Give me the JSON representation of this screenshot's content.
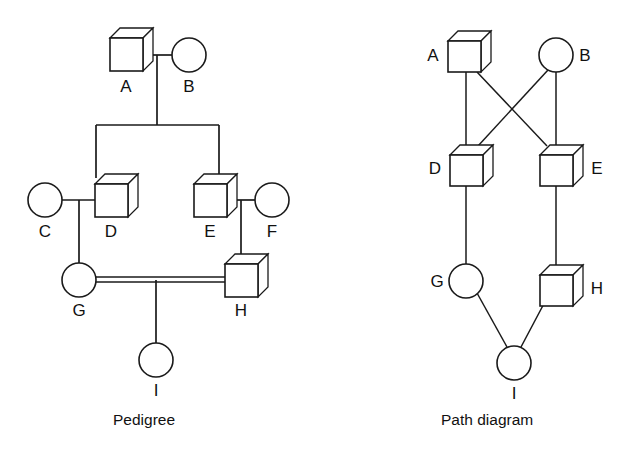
{
  "figure": {
    "background_color": "#ffffff",
    "line_color": "#1a1a1a",
    "shape_fill": "#ffffff"
  },
  "panels": [
    {
      "id": "pedigree",
      "caption": "Pedigree",
      "nodes": [
        {
          "id": "A",
          "label": "A",
          "shape": "square",
          "generation": 1
        },
        {
          "id": "B",
          "label": "B",
          "shape": "circle",
          "generation": 1
        },
        {
          "id": "C",
          "label": "C",
          "shape": "circle",
          "generation": 2
        },
        {
          "id": "D",
          "label": "D",
          "shape": "square",
          "generation": 2
        },
        {
          "id": "E",
          "label": "E",
          "shape": "square",
          "generation": 2
        },
        {
          "id": "F",
          "label": "F",
          "shape": "circle",
          "generation": 2
        },
        {
          "id": "G",
          "label": "G",
          "shape": "circle",
          "generation": 3
        },
        {
          "id": "H",
          "label": "H",
          "shape": "square",
          "generation": 3
        },
        {
          "id": "I",
          "label": "I",
          "shape": "circle",
          "generation": 4
        }
      ],
      "matings": [
        {
          "partners": [
            "A",
            "B"
          ],
          "type": "single-line",
          "children": [
            "D",
            "E"
          ]
        },
        {
          "partners": [
            "C",
            "D"
          ],
          "type": "single-line",
          "children": [
            "G"
          ]
        },
        {
          "partners": [
            "E",
            "F"
          ],
          "type": "single-line",
          "children": [
            "H"
          ]
        },
        {
          "partners": [
            "G",
            "H"
          ],
          "type": "double-line-consanguineous",
          "children": [
            "I"
          ]
        }
      ]
    },
    {
      "id": "path-diagram",
      "caption": "Path diagram",
      "nodes": [
        {
          "id": "A",
          "label": "A",
          "shape": "square",
          "label_side": "left"
        },
        {
          "id": "B",
          "label": "B",
          "shape": "circle",
          "label_side": "right"
        },
        {
          "id": "D",
          "label": "D",
          "shape": "square",
          "label_side": "left"
        },
        {
          "id": "E",
          "label": "E",
          "shape": "square",
          "label_side": "right"
        },
        {
          "id": "G",
          "label": "G",
          "shape": "circle",
          "label_side": "left"
        },
        {
          "id": "H",
          "label": "H",
          "shape": "square",
          "label_side": "right"
        },
        {
          "id": "I",
          "label": "I",
          "shape": "circle",
          "label_side": "below"
        }
      ],
      "paths": [
        {
          "from": "A",
          "to": "D"
        },
        {
          "from": "A",
          "to": "E"
        },
        {
          "from": "B",
          "to": "D"
        },
        {
          "from": "B",
          "to": "E"
        },
        {
          "from": "D",
          "to": "G"
        },
        {
          "from": "E",
          "to": "H"
        },
        {
          "from": "G",
          "to": "I"
        },
        {
          "from": "H",
          "to": "I"
        }
      ]
    }
  ]
}
